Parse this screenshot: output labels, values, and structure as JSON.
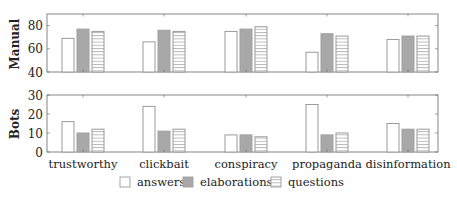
{
  "chart_data": [
    {
      "type": "bar",
      "panel": "Manual",
      "ylabel": "Manual",
      "xlabel": "",
      "title": "",
      "categories": [
        "trustworthy",
        "clickbait",
        "conspiracy",
        "propaganda",
        "disinformation"
      ],
      "series": [
        {
          "name": "answers",
          "values": [
            69,
            66,
            75,
            57,
            68
          ]
        },
        {
          "name": "elaborations",
          "values": [
            77,
            76,
            77,
            73,
            71
          ]
        },
        {
          "name": "questions",
          "values": [
            75,
            75,
            79,
            71,
            71
          ]
        }
      ],
      "ylim": [
        40,
        90
      ],
      "yticks": [
        40,
        60,
        80
      ],
      "grid": false
    },
    {
      "type": "bar",
      "panel": "Bots",
      "ylabel": "Bots",
      "xlabel": "",
      "title": "",
      "categories": [
        "trustworthy",
        "clickbait",
        "conspiracy",
        "propaganda",
        "disinformation"
      ],
      "series": [
        {
          "name": "answers",
          "values": [
            16,
            24,
            9,
            25,
            15
          ]
        },
        {
          "name": "elaborations",
          "values": [
            10,
            11,
            9,
            9,
            12
          ]
        },
        {
          "name": "questions",
          "values": [
            12,
            12,
            8,
            10,
            12
          ]
        }
      ],
      "ylim": [
        0,
        30
      ],
      "yticks": [
        0,
        10,
        20,
        30
      ],
      "grid": false
    }
  ],
  "legend": {
    "position": "bottom",
    "items": [
      {
        "label": "answers",
        "style": "white"
      },
      {
        "label": "elaborations",
        "style": "gray"
      },
      {
        "label": "questions",
        "style": "horizontal-lines"
      }
    ]
  },
  "colors": {
    "axis": "#555555",
    "bar_outline": "#9a9a9a",
    "answers_fill": "#ffffff",
    "elaborations_fill": "#a8a8a8",
    "questions_fill": "#ffffff",
    "questions_hatch": "#9a9a9a"
  }
}
